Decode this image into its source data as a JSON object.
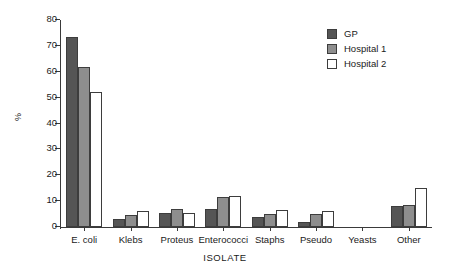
{
  "chart_data": {
    "type": "bar",
    "title": "",
    "xlabel": "ISOLATE",
    "ylabel": "%",
    "ylim": [
      0,
      80
    ],
    "yticks": [
      0,
      10,
      20,
      30,
      40,
      50,
      60,
      70,
      80
    ],
    "grid": false,
    "legend_position": "top-right",
    "categories": [
      "E. coli",
      "Klebs",
      "Proteus",
      "Enterococci",
      "Staphs",
      "Pseudo",
      "Yeasts",
      "Other"
    ],
    "series": [
      {
        "name": "GP",
        "color": "#555555",
        "values": [
          73.5,
          3.0,
          5.5,
          7.0,
          4.0,
          2.0,
          0.0,
          8.0
        ]
      },
      {
        "name": "Hospital 1",
        "color": "#8e8e8e",
        "values": [
          62.0,
          4.5,
          7.0,
          11.5,
          5.0,
          5.0,
          0.0,
          8.5
        ]
      },
      {
        "name": "Hospital 2",
        "color": "#ffffff",
        "values": [
          52.3,
          6.0,
          5.3,
          11.8,
          6.5,
          6.0,
          0.0,
          15.0
        ]
      }
    ]
  },
  "axis": {
    "y_title": "%",
    "x_title": "ISOLATE",
    "y_ticks": [
      "0",
      "10",
      "20",
      "30",
      "40",
      "50",
      "60",
      "70",
      "80"
    ],
    "x_ticks": [
      "E. coli",
      "Klebs",
      "Proteus",
      "Enterococci",
      "Staphs",
      "Pseudo",
      "Yeasts",
      "Other"
    ]
  },
  "legend": {
    "items": [
      {
        "label": "GP"
      },
      {
        "label": "Hospital 1"
      },
      {
        "label": "Hospital 2"
      }
    ]
  }
}
